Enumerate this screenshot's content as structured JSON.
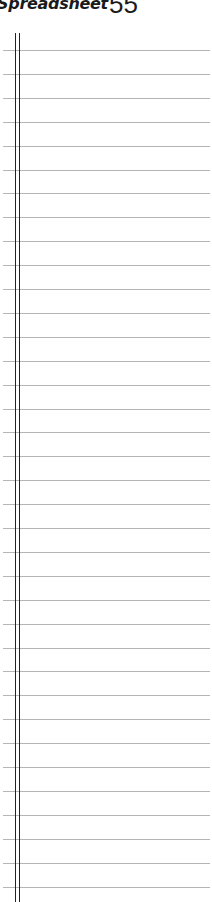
{
  "header": {
    "section_title": "Spreadsheet",
    "page_number": "55"
  },
  "ruled_sheet": {
    "line_count": 36,
    "first_line_y": 50,
    "line_spacing": 23.9,
    "line_color": "#b5b5b5",
    "margin_line_color": "#222222"
  }
}
